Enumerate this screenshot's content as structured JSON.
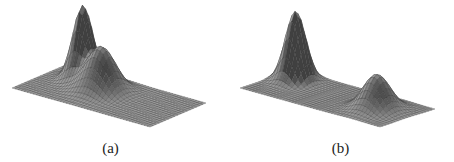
{
  "figure": {
    "panels": [
      {
        "id": "a",
        "caption": "(a)",
        "description": "3D mesh surface: two overlapping Gaussian peaks (tall narrow peak merged with a lower broader hump)",
        "plane": {
          "origin": [
            12,
            88
          ],
          "u": [
            138,
            39
          ],
          "v": [
            56,
            -24
          ]
        },
        "grid": {
          "nu": 46,
          "nv": 18
        },
        "height_scale": 72,
        "peaks": [
          {
            "u": 0.22,
            "v": 0.72,
            "amp": 1.0,
            "su": 0.055,
            "sv": 0.12
          },
          {
            "u": 0.42,
            "v": 0.55,
            "amp": 0.62,
            "su": 0.09,
            "sv": 0.16
          }
        ]
      },
      {
        "id": "b",
        "caption": "(b)",
        "description": "3D mesh surface: two well-separated Gaussian peaks (tall narrow peak and a lower broader hump)",
        "plane": {
          "origin": [
            13,
            88
          ],
          "u": [
            140,
            39
          ],
          "v": [
            55,
            -18
          ]
        },
        "grid": {
          "nu": 46,
          "nv": 18
        },
        "height_scale": 70,
        "peaks": [
          {
            "u": 0.13,
            "v": 0.68,
            "amp": 1.0,
            "su": 0.055,
            "sv": 0.13
          },
          {
            "u": 0.78,
            "v": 0.5,
            "amp": 0.5,
            "su": 0.075,
            "sv": 0.17
          }
        ]
      }
    ],
    "colors": {
      "mesh_line": "#3a3a3a",
      "face_light": "#c8c8c8",
      "face_dark": "#6e6e6e",
      "background": "#ffffff"
    }
  }
}
